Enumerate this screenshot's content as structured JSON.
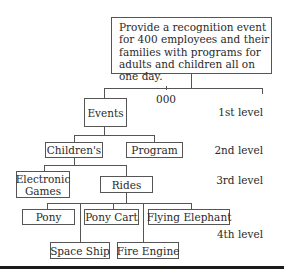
{
  "diagram": {
    "type": "work-breakdown-structure",
    "goal": "Provide a recognition event for 400 employees and their families with programs for adults and children all on one day.",
    "root_code": "000",
    "levels": [
      "1st level",
      "2nd level",
      "3rd level",
      "4th level"
    ],
    "nodes": {
      "events": "Events",
      "childrens": "Children's",
      "program": "Program",
      "electronic_games": "Electronic Games",
      "electronic_games_line1": "Electronic",
      "electronic_games_line2": "Games",
      "rides": "Rides",
      "pony": "Pony",
      "pony_cart": "Pony Cart",
      "flying_elephant": "Flying Elephant",
      "space_ship": "Space Ship",
      "fire_engine": "Fire Engine"
    },
    "edges": [
      [
        "goal",
        "events"
      ],
      [
        "events",
        "childrens"
      ],
      [
        "events",
        "program"
      ],
      [
        "childrens",
        "electronic_games"
      ],
      [
        "childrens",
        "rides"
      ],
      [
        "rides",
        "pony"
      ],
      [
        "rides",
        "pony_cart"
      ],
      [
        "rides",
        "flying_elephant"
      ],
      [
        "rides",
        "space_ship"
      ],
      [
        "rides",
        "fire_engine"
      ]
    ]
  }
}
